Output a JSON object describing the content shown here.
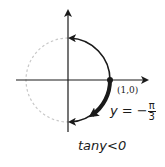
{
  "diagram": {
    "type": "unit-circle",
    "center": [
      68,
      80
    ],
    "radius": 40,
    "colors": {
      "axis": "#1a1a1a",
      "circle_dashed": "#c8c8c8",
      "arc": "#1a1a1a",
      "highlight_arc": "#1a1a1a"
    },
    "labels": {
      "point": "(1,0)",
      "equation_lhs": "y = −",
      "fraction_num": "π",
      "fraction_den": "3",
      "condition": "tany<0"
    },
    "elements": [
      "x-axis with arrow pointing right",
      "y-axis with arrow pointing up",
      "dashed unit circle (left half)",
      "solid arc from (1,0) up to (0,1) with arrow",
      "solid arc from (1,0) down to (0,-1) with arrow",
      "bold arc from (1,0) to angle -π/3 with arrow",
      "dot at point (1,0)"
    ]
  }
}
